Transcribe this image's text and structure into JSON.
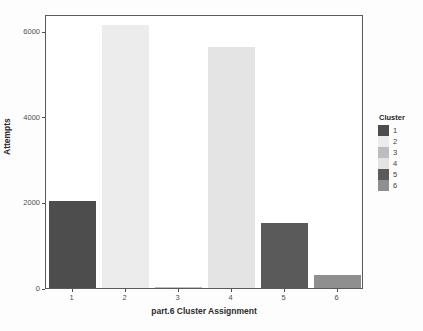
{
  "chart_data": {
    "type": "bar",
    "title": "",
    "xlabel": "part.6 Cluster Assignment",
    "ylabel": "Attempts",
    "categories": [
      "1",
      "2",
      "3",
      "4",
      "5",
      "6"
    ],
    "values": [
      2040,
      6150,
      30,
      5620,
      1510,
      310
    ],
    "series": [
      {
        "name": "Attempts",
        "values": [
          2040,
          6150,
          30,
          5620,
          1510,
          310
        ]
      }
    ],
    "ylim": [
      0,
      6400
    ],
    "yticks": [
      0,
      2000,
      4000,
      6000
    ],
    "ytick_labels": [
      "0",
      "2000",
      "4000",
      "6000"
    ],
    "xtick_labels": [
      "1",
      "2",
      "3",
      "4",
      "5",
      "6"
    ],
    "grid": false,
    "legend": {
      "title": "Cluster",
      "position": "right",
      "entries": [
        {
          "label": "1",
          "color": "#4d4d4d"
        },
        {
          "label": "2",
          "color": "#ececec"
        },
        {
          "label": "3",
          "color": "#bdbdbd"
        },
        {
          "label": "4",
          "color": "#e4e4e4"
        },
        {
          "label": "5",
          "color": "#5a5a5a"
        },
        {
          "label": "6",
          "color": "#8f8f8f"
        }
      ]
    },
    "bar_colors": [
      "#4d4d4d",
      "#ececec",
      "#bdbdbd",
      "#e4e4e4",
      "#5a5a5a",
      "#8f8f8f"
    ],
    "panel_background": "#ffffff",
    "panel_border": "#5a5a5a",
    "page_background": "#fdfdfd"
  },
  "axes": {
    "y_title": "Attempts",
    "x_title": "part.6 Cluster Assignment"
  },
  "legend_block": {
    "title": "Cluster"
  }
}
